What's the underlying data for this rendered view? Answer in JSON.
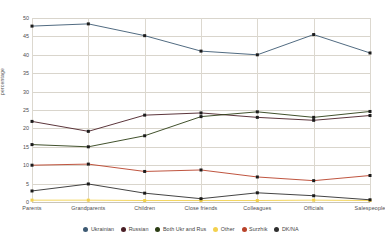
{
  "chart_data": {
    "type": "line",
    "title": "",
    "xlabel": "",
    "ylabel": "percentage",
    "ylim": [
      0,
      50
    ],
    "ytick_step": 5,
    "grid": true,
    "legend_position": "bottom",
    "categories": [
      "Parents",
      "Grandparents",
      "Children",
      "Close friends",
      "Colleagues",
      "Officials",
      "Salespeople"
    ],
    "yticks": [
      "0",
      "5",
      "10",
      "15",
      "20",
      "25",
      "30",
      "35",
      "40",
      "45",
      "50"
    ],
    "series": [
      {
        "name": "Ukrainian",
        "color": "#3d5a73",
        "values": [
          47.8,
          48.4,
          45.2,
          41.0,
          40.0,
          45.5,
          40.5
        ]
      },
      {
        "name": "Russian",
        "color": "#4a1f26",
        "values": [
          21.9,
          19.2,
          23.6,
          24.2,
          23.0,
          22.2,
          23.5
        ]
      },
      {
        "name": "Both Ukr and Rus",
        "color": "#2b3d14",
        "values": [
          15.6,
          15.0,
          18.0,
          23.2,
          24.5,
          23.0,
          24.6
        ]
      },
      {
        "name": "Other",
        "color": "#f3d14e",
        "values": [
          0.5,
          0.5,
          0.4,
          0.4,
          0.4,
          0.5,
          0.4
        ]
      },
      {
        "name": "Surzhik",
        "color": "#b8422a",
        "values": [
          10.0,
          10.3,
          8.3,
          8.7,
          6.8,
          5.8,
          7.2
        ]
      },
      {
        "name": "DK/NA",
        "color": "#2f2f2f",
        "values": [
          3.0,
          4.9,
          2.4,
          0.9,
          2.5,
          1.7,
          0.6
        ]
      }
    ]
  }
}
